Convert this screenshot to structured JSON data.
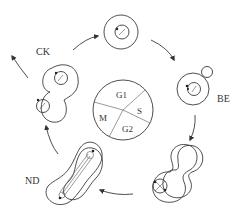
{
  "diagram": {
    "type": "cell-cycle",
    "center_phases": [
      "G1",
      "S",
      "G2",
      "M"
    ],
    "stage_labels": {
      "budding": "BE",
      "nuclear_division": "ND",
      "cytokinesis": "CK"
    },
    "stages": [
      {
        "id": "g1-cell",
        "label": ""
      },
      {
        "id": "bud-emergence",
        "label": "BE"
      },
      {
        "id": "bud-growth",
        "label": ""
      },
      {
        "id": "nuclear-division",
        "label": "ND"
      },
      {
        "id": "cytokinesis",
        "label": "CK"
      }
    ],
    "flow": "clockwise"
  }
}
